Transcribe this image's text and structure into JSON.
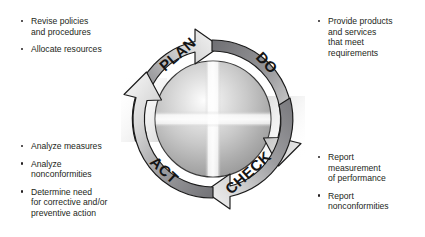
{
  "diagram": {
    "type": "pdca-cycle",
    "center_label": "",
    "rotation_direction": "clockwise",
    "phases": [
      {
        "id": "plan",
        "label": "PLAN",
        "position": "top-left"
      },
      {
        "id": "do",
        "label": "DO",
        "position": "top-right"
      },
      {
        "id": "check",
        "label": "CHECK",
        "position": "bottom-right"
      },
      {
        "id": "act",
        "label": "ACT",
        "position": "bottom-left"
      }
    ],
    "colors": {
      "arrow_dark": "#6e6e70",
      "arrow_light": "#f2f2f2",
      "outline": "#1a1a1a",
      "text": "#231f20",
      "background": "#ffffff"
    }
  },
  "blocks": {
    "plan": {
      "phase": "PLAN",
      "items": [
        "Revise policies\nand procedures",
        "Allocate resources"
      ]
    },
    "do": {
      "phase": "DO",
      "items": [
        "Provide products\nand services\nthat meet\nrequirements"
      ]
    },
    "act": {
      "phase": "ACT",
      "items": [
        "Analyze measures",
        "Analyze\nnonconformities",
        "Determine need\nfor corrective and/or\npreventive action"
      ]
    },
    "check": {
      "phase": "CHECK",
      "items": [
        "Report\nmeasurement\nof performance",
        "Report\nnonconformities"
      ]
    }
  }
}
